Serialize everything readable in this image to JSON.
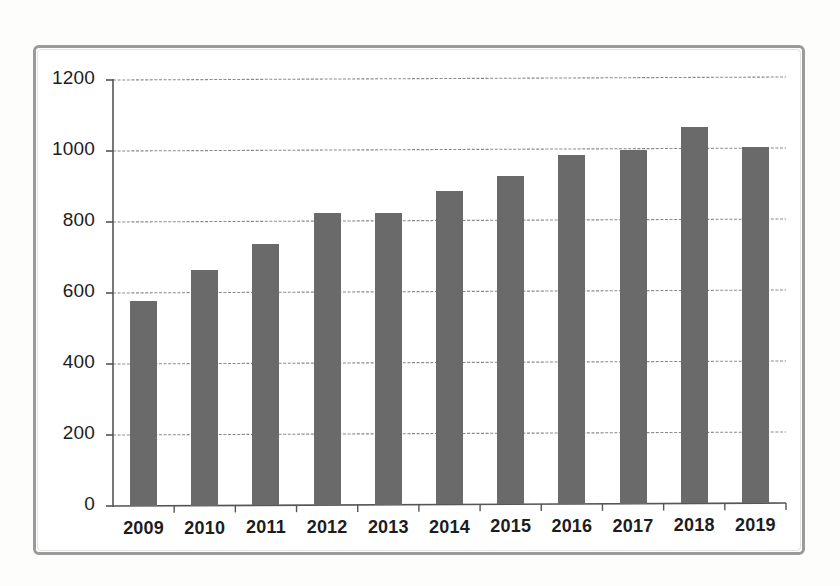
{
  "chart_data": {
    "type": "bar",
    "title": "",
    "subtitle": "",
    "xlabel": "",
    "ylabel": "",
    "categories": [
      "2009",
      "2010",
      "2011",
      "2012",
      "2013",
      "2014",
      "2015",
      "2016",
      "2017",
      "2018",
      "2019"
    ],
    "values": [
      578,
      665,
      737,
      825,
      824,
      887,
      930,
      990,
      1003,
      1068,
      1012
    ],
    "series": [
      {
        "name": "",
        "values": [
          578,
          665,
          737,
          825,
          824,
          887,
          930,
          990,
          1003,
          1068,
          1012
        ]
      }
    ],
    "ylim": [
      0,
      1200
    ],
    "ytick_values": [
      0,
      200,
      400,
      600,
      800,
      1000,
      1200
    ],
    "ytick_labels": [
      "0",
      "200",
      "400",
      "600",
      "800",
      "1000",
      "1200"
    ],
    "grid": true,
    "grid_axis": "y",
    "legend": false,
    "legend_position": "none",
    "bar_color": "#6a6a6a",
    "frame_color": "#9a9a9a",
    "axis_color": "#555555",
    "grid_color": "#8a8a8a",
    "text_color": "#1d1d1d",
    "background_color": "#ffffff"
  }
}
